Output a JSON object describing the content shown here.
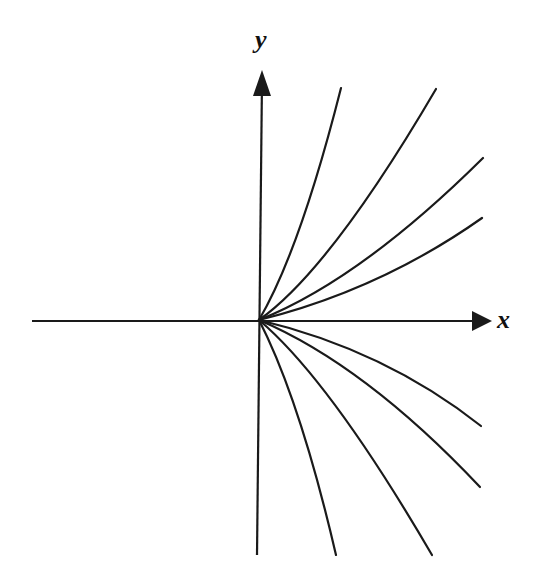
{
  "diagram": {
    "type": "phase portrait (node / family of curves through origin)",
    "axes": {
      "x": {
        "label": "x",
        "from": [
          32,
          321
        ],
        "to": [
          492,
          321
        ]
      },
      "y": {
        "label": "y",
        "from": [
          257,
          555
        ],
        "to": [
          262,
          70
        ]
      }
    },
    "origin": [
      259,
      320
    ],
    "curves_upper": [
      {
        "end": [
          341,
          88
        ],
        "ctrl": [
          300,
          250
        ]
      },
      {
        "end": [
          436,
          89
        ],
        "ctrl": [
          330,
          270
        ]
      },
      {
        "end": [
          483,
          158
        ],
        "ctrl": [
          360,
          280
        ]
      },
      {
        "end": [
          482,
          218
        ],
        "ctrl": [
          380,
          290
        ]
      }
    ],
    "curves_lower": [
      {
        "end": [
          336,
          555
        ],
        "ctrl": [
          300,
          400
        ]
      },
      {
        "end": [
          432,
          555
        ],
        "ctrl": [
          330,
          380
        ]
      },
      {
        "end": [
          480,
          487
        ],
        "ctrl": [
          365,
          365
        ]
      },
      {
        "end": [
          481,
          426
        ],
        "ctrl": [
          385,
          350
        ]
      }
    ],
    "colors": {
      "stroke": "#1a1a1a",
      "background": "#ffffff"
    }
  }
}
